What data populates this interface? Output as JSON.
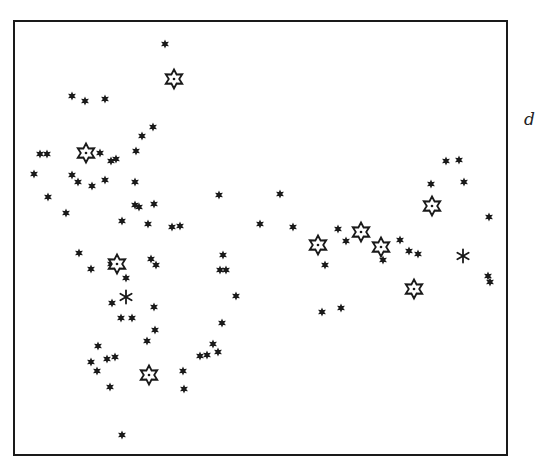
{
  "figure": {
    "panel_label": "d",
    "frame": {
      "left": 13,
      "top": 20,
      "right": 508,
      "bottom": 456
    },
    "colors": {
      "ink": "#1a1a1a",
      "background": "#ffffff"
    }
  },
  "chart_data": {
    "type": "scatter",
    "title": "",
    "xlabel": "",
    "ylabel": "",
    "panel_label": "d",
    "grid": false,
    "legend": null,
    "coordinate_space": "image pixels (origin top-left)",
    "series": [
      {
        "name": "small filled stars",
        "marker": "filled-star-small",
        "points": [
          [
            165,
            44
          ],
          [
            72,
            96
          ],
          [
            85,
            101
          ],
          [
            105,
            99
          ],
          [
            153,
            127
          ],
          [
            142,
            136
          ],
          [
            136,
            151
          ],
          [
            40,
            154
          ],
          [
            47,
            154
          ],
          [
            100,
            153
          ],
          [
            111,
            161
          ],
          [
            116,
            159
          ],
          [
            34,
            174
          ],
          [
            72,
            175
          ],
          [
            78,
            182
          ],
          [
            92,
            186
          ],
          [
            105,
            180
          ],
          [
            135,
            182
          ],
          [
            48,
            197
          ],
          [
            66,
            213
          ],
          [
            135,
            205
          ],
          [
            139,
            207
          ],
          [
            154,
            204
          ],
          [
            122,
            221
          ],
          [
            148,
            224
          ],
          [
            172,
            227
          ],
          [
            180,
            226
          ],
          [
            219,
            195
          ],
          [
            260,
            224
          ],
          [
            280,
            194
          ],
          [
            293,
            227
          ],
          [
            79,
            253
          ],
          [
            91,
            269
          ],
          [
            111,
            264
          ],
          [
            126,
            278
          ],
          [
            151,
            259
          ],
          [
            156,
            265
          ],
          [
            223,
            255
          ],
          [
            220,
            270
          ],
          [
            226,
            270
          ],
          [
            236,
            296
          ],
          [
            112,
            303
          ],
          [
            121,
            318
          ],
          [
            132,
            318
          ],
          [
            155,
            330
          ],
          [
            154,
            307
          ],
          [
            147,
            341
          ],
          [
            98,
            346
          ],
          [
            107,
            359
          ],
          [
            115,
            357
          ],
          [
            91,
            362
          ],
          [
            97,
            371
          ],
          [
            110,
            387
          ],
          [
            222,
            323
          ],
          [
            213,
            344
          ],
          [
            218,
            352
          ],
          [
            207,
            355
          ],
          [
            200,
            356
          ],
          [
            183,
            371
          ],
          [
            184,
            389
          ],
          [
            122,
            435
          ],
          [
            325,
            265
          ],
          [
            322,
            312
          ],
          [
            341,
            308
          ],
          [
            338,
            229
          ],
          [
            346,
            241
          ],
          [
            383,
            260
          ],
          [
            400,
            240
          ],
          [
            409,
            251
          ],
          [
            418,
            254
          ],
          [
            431,
            184
          ],
          [
            446,
            161
          ],
          [
            459,
            160
          ],
          [
            464,
            182
          ],
          [
            489,
            217
          ],
          [
            488,
            276
          ],
          [
            490,
            282
          ]
        ]
      },
      {
        "name": "six-point asterisks",
        "marker": "asterisk",
        "points": [
          [
            126,
            297
          ],
          [
            463,
            256
          ]
        ]
      },
      {
        "name": "large open stars (dotted center)",
        "marker": "open-star-large",
        "points": [
          [
            174,
            79
          ],
          [
            86,
            153
          ],
          [
            117,
            264
          ],
          [
            149,
            375
          ],
          [
            318,
            245
          ],
          [
            361,
            232
          ],
          [
            381,
            247
          ],
          [
            432,
            206
          ],
          [
            414,
            289
          ]
        ]
      }
    ]
  }
}
